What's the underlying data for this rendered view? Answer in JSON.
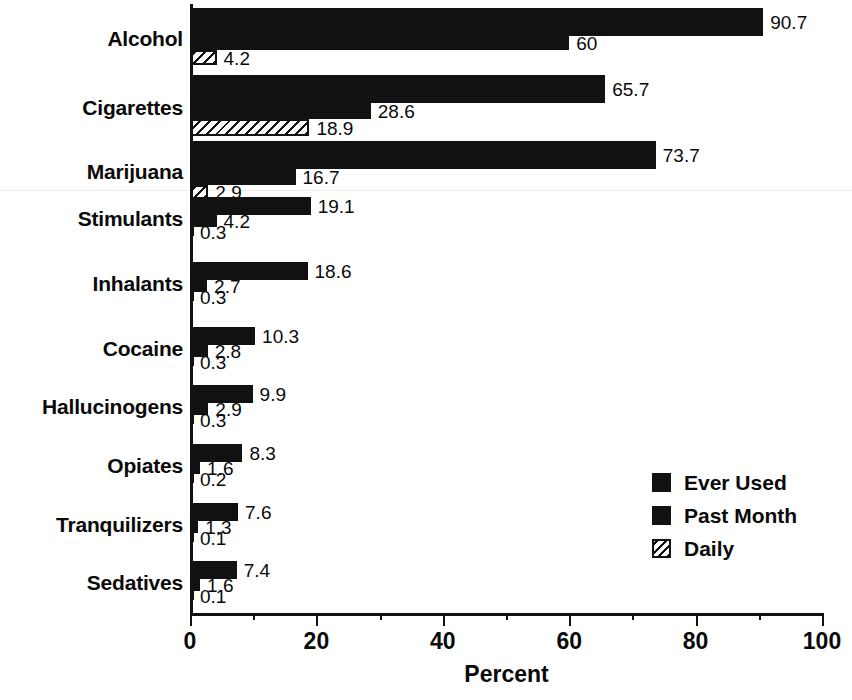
{
  "chart_data": {
    "type": "bar",
    "orientation": "horizontal",
    "title": "",
    "xlabel": "Percent",
    "ylabel": "",
    "xlim": [
      0,
      100
    ],
    "xticks": [
      0,
      20,
      40,
      60,
      80,
      100
    ],
    "xticks_minor": [
      10,
      30,
      50,
      70,
      90
    ],
    "grid": false,
    "legend_position": "bottom-right",
    "categories": [
      "Alcohol",
      "Cigarettes",
      "Marijuana",
      "Stimulants",
      "Inhalants",
      "Cocaine",
      "Hallucinogens",
      "Opiates",
      "Tranquilizers",
      "Sedatives"
    ],
    "series": [
      {
        "name": "Ever Used",
        "fill": "solid",
        "values": [
          90.7,
          65.7,
          73.7,
          19.1,
          18.6,
          10.3,
          9.9,
          8.3,
          7.6,
          7.4
        ],
        "labels": [
          "90.7",
          "65.7",
          "73.7",
          "19.1",
          "18.6",
          "10.3",
          "9.9",
          "8.3",
          "7.6",
          "7.4"
        ]
      },
      {
        "name": "Past Month",
        "fill": "solid",
        "values": [
          60,
          28.6,
          16.7,
          4.2,
          2.7,
          2.8,
          2.9,
          1.6,
          1.3,
          1.6
        ],
        "labels": [
          "60",
          "28.6",
          "16.7",
          "4.2",
          "2.7",
          "2.8",
          "2.9",
          "1.6",
          "1.3",
          "1.6"
        ]
      },
      {
        "name": "Daily",
        "fill": "hatch",
        "values": [
          4.2,
          18.9,
          2.9,
          0.3,
          0.3,
          0.3,
          0.3,
          0.2,
          0.1,
          0.1
        ],
        "labels": [
          "4.2",
          "18.9",
          "2.9",
          "0.3",
          "0.3",
          "0.3",
          "0.3",
          "0.2",
          "0.1",
          "0.1"
        ]
      }
    ]
  },
  "axis": {
    "tick_labels": [
      "0",
      "20",
      "40",
      "60",
      "80",
      "100"
    ],
    "title": "Percent"
  },
  "legend": {
    "items": [
      {
        "label": "Ever Used",
        "fill": "solid"
      },
      {
        "label": "Past Month",
        "fill": "solid"
      },
      {
        "label": "Daily",
        "fill": "hatch"
      }
    ]
  },
  "colors": {
    "bar": "#111111",
    "background": "#ffffff",
    "text": "#0a0a0a"
  }
}
